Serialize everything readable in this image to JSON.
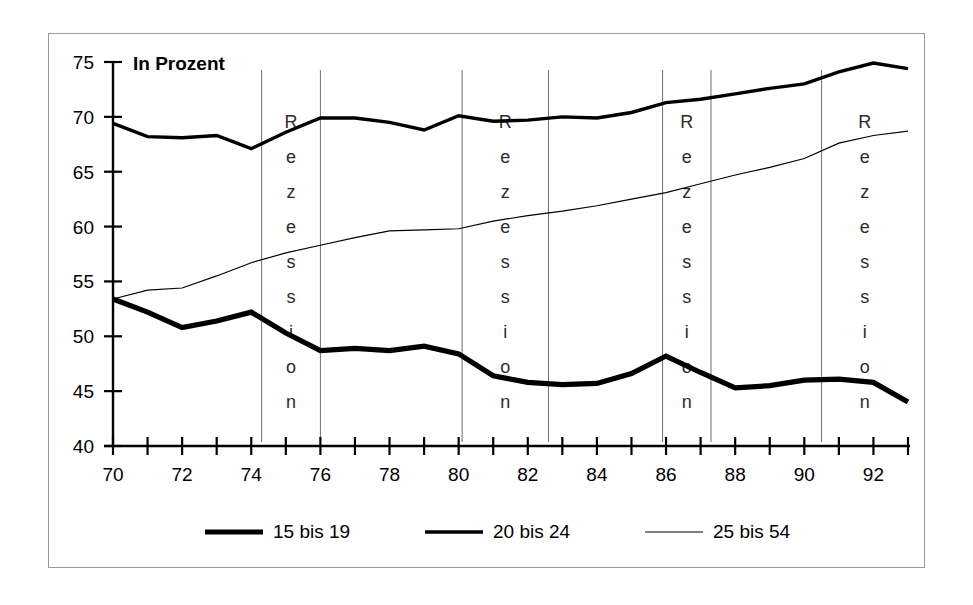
{
  "chart_data": {
    "type": "line",
    "title": "",
    "subtitle": "",
    "axis_note": "In Prozent",
    "xlabel": "",
    "ylabel": "",
    "ylim": [
      40,
      75
    ],
    "xlim": [
      70,
      93
    ],
    "y_ticks": [
      40,
      45,
      50,
      55,
      60,
      65,
      70,
      75
    ],
    "x_ticks": [
      70,
      71,
      72,
      73,
      74,
      75,
      76,
      77,
      78,
      79,
      80,
      81,
      82,
      83,
      84,
      85,
      86,
      87,
      88,
      89,
      90,
      91,
      92,
      93
    ],
    "x_tick_labels": [
      "70",
      "",
      "72",
      "",
      "74",
      "",
      "76",
      "",
      "78",
      "",
      "80",
      "",
      "82",
      "",
      "84",
      "",
      "86",
      "",
      "88",
      "",
      "90",
      "",
      "92",
      ""
    ],
    "grid": false,
    "legend_position": "bottom",
    "x": [
      70,
      71,
      72,
      73,
      74,
      75,
      76,
      77,
      78,
      79,
      80,
      81,
      82,
      83,
      84,
      85,
      86,
      87,
      88,
      89,
      90,
      91,
      92,
      93
    ],
    "series": [
      {
        "name": "15 bis 19",
        "line_weight": "thickest",
        "color": "#000000",
        "values": [
          53.4,
          52.2,
          50.8,
          51.4,
          52.2,
          50.3,
          48.7,
          48.9,
          48.7,
          49.1,
          48.4,
          46.4,
          45.8,
          45.6,
          45.7,
          46.6,
          48.2,
          46.7,
          45.3,
          45.5,
          46.0,
          46.1,
          45.8,
          44.0
        ]
      },
      {
        "name": "20 bis 24",
        "line_weight": "medium",
        "color": "#000000",
        "values": [
          69.4,
          68.2,
          68.1,
          68.3,
          67.1,
          68.6,
          69.9,
          69.9,
          69.5,
          68.8,
          70.1,
          69.6,
          69.7,
          70.0,
          69.9,
          70.4,
          71.3,
          71.6,
          72.1,
          72.6,
          73.0,
          74.1,
          74.9,
          74.4
        ]
      },
      {
        "name": "25 bis 54",
        "line_weight": "thin",
        "color": "#000000",
        "values": [
          53.4,
          54.2,
          54.4,
          55.5,
          56.7,
          57.6,
          58.3,
          59.0,
          59.6,
          59.7,
          59.8,
          60.5,
          61.0,
          61.4,
          61.9,
          62.5,
          63.1,
          63.9,
          64.7,
          65.4,
          66.2,
          67.6,
          68.3,
          68.7
        ]
      }
    ],
    "recession_bands": [
      {
        "label": "Rezession",
        "start": 74.3,
        "end": 76.0
      },
      {
        "label": "Rezession",
        "start": 80.1,
        "end": 82.6
      },
      {
        "label": "Rezession",
        "start": 85.9,
        "end": 87.3
      },
      {
        "label": "Rezession",
        "start": 90.5,
        "end": 93.0
      }
    ],
    "recession_letters": [
      "R",
      "e",
      "z",
      "e",
      "s",
      "s",
      "i",
      "o",
      "n"
    ]
  },
  "legend": {
    "items": [
      {
        "label": "15 bis 19",
        "weight": "thickest"
      },
      {
        "label": "20 bis 24",
        "weight": "medium"
      },
      {
        "label": "25 bis 54",
        "weight": "thin"
      }
    ]
  },
  "colors": {
    "line": "#000000",
    "gridline": "#6e6e6e",
    "frame": "#9a9a9a",
    "background": "#ffffff"
  }
}
